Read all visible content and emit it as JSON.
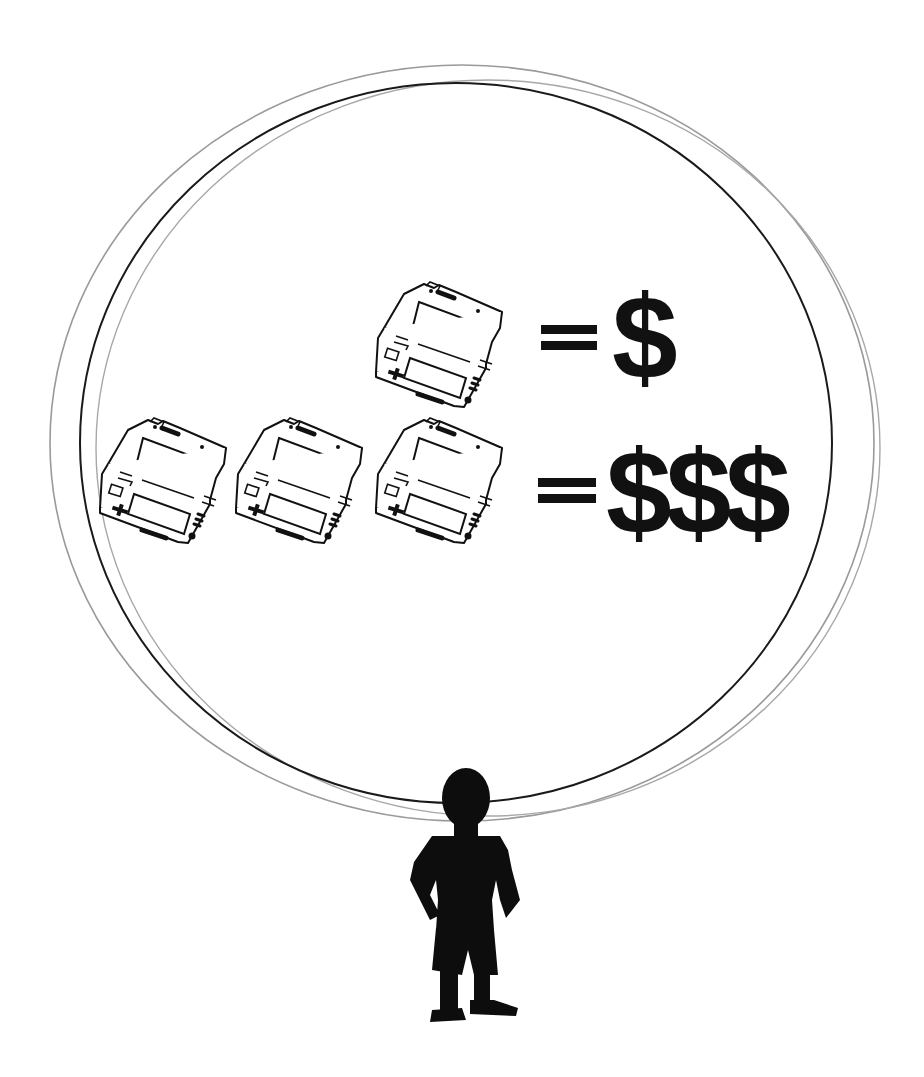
{
  "illustration": {
    "description": "Child standing under a bubble showing a handheld game console equals one dollar sign, and three consoles equal three dollar signs",
    "colors": {
      "ink": "#111111",
      "circle_primary": "#1a1a1a",
      "circle_secondary": "#9a9a9a",
      "background": "#ffffff"
    },
    "rows": [
      {
        "console_count": 1,
        "equals_symbol": "=",
        "value_label": "$"
      },
      {
        "console_count": 3,
        "equals_symbol": "=",
        "value_label": "$$$"
      }
    ],
    "figure": "child-silhouette"
  }
}
